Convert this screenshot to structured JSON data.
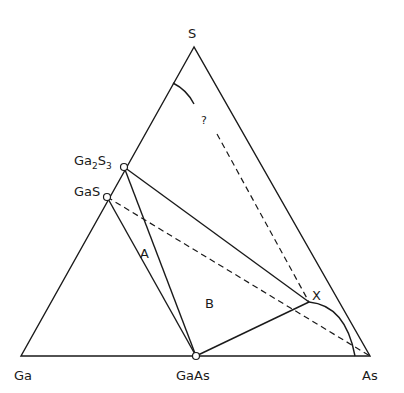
{
  "diagram": {
    "type": "ternary phase diagram",
    "vertices": {
      "top": {
        "label": "S",
        "x": 194,
        "y": 47
      },
      "left": {
        "label": "Ga",
        "x": 21,
        "y": 356
      },
      "right": {
        "label": "As",
        "x": 370,
        "y": 356
      }
    },
    "compounds": [
      {
        "label": "Ga",
        "sub": "2",
        "label2": "S",
        "sub2": "3",
        "x": 124,
        "y": 167
      },
      {
        "label": "GaS",
        "x": 107,
        "y": 197
      },
      {
        "label": "GaAs",
        "x": 196,
        "y": 356
      }
    ],
    "point_x": {
      "label": "X",
      "x": 309,
      "y": 302
    },
    "regions": [
      {
        "label": "A",
        "x": 145,
        "y": 256
      },
      {
        "label": "B",
        "x": 210,
        "y": 306
      }
    ],
    "unknown_marker": {
      "label": "?",
      "x": 204,
      "y": 122
    }
  }
}
